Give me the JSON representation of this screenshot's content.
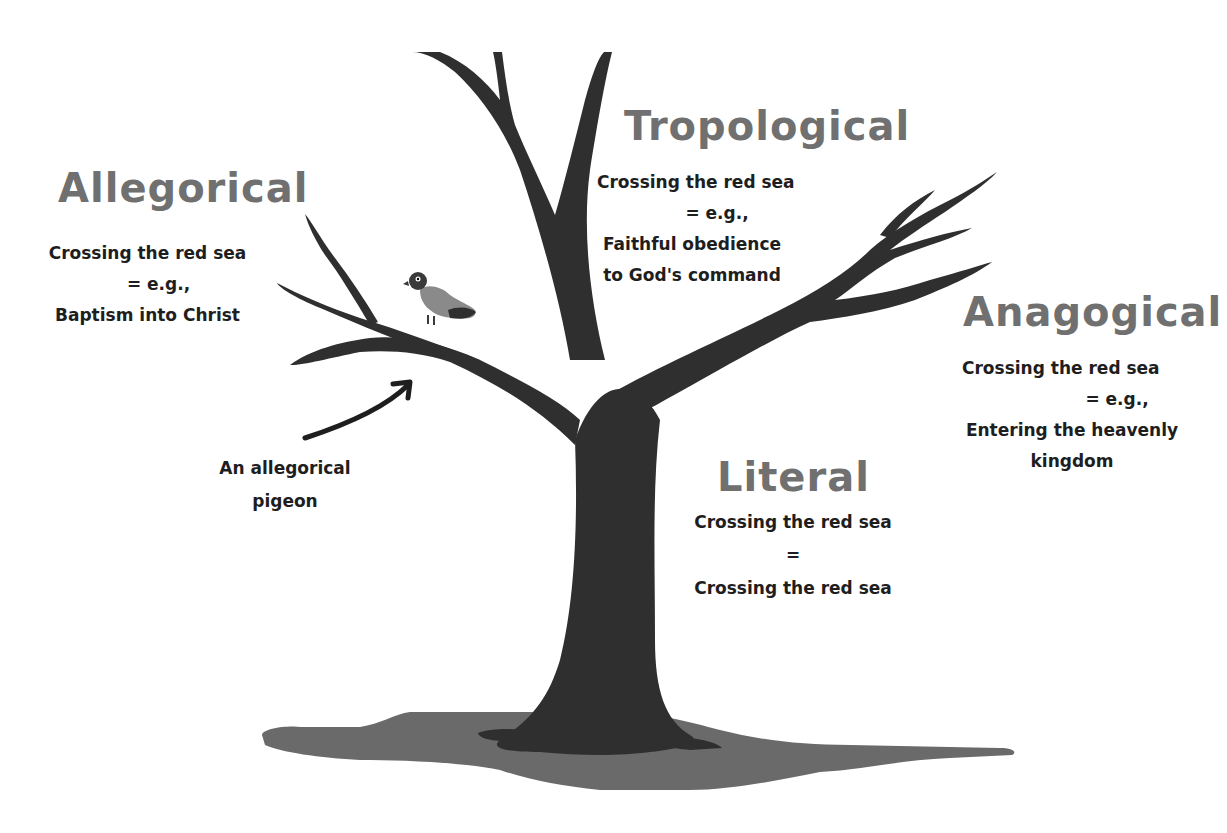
{
  "colors": {
    "tree": "#2f2f2f",
    "shadow": "#6a6a6a",
    "title": "#707070",
    "text": "#1e1e1e",
    "pigeon_body": "#8a8a8a",
    "background": "#ffffff"
  },
  "senses": {
    "allegorical": {
      "title": "Allegorical",
      "line1": "Crossing the red sea",
      "line2": "=  e.g.,",
      "line3": "Baptism into Christ"
    },
    "tropological": {
      "title": "Tropological",
      "line1": "Crossing the red sea",
      "line2": "=  e.g.,",
      "line3": "Faithful obedience",
      "line4": "to God's command"
    },
    "anagogical": {
      "title": "Anagogical",
      "line1": "Crossing the red sea",
      "line2": "=  e.g.,",
      "line3": "Entering the heavenly",
      "line4": "kingdom"
    },
    "literal": {
      "title": "Literal",
      "line1": "Crossing the red sea",
      "line2": "=",
      "line3": "Crossing the red sea"
    }
  },
  "annotation": {
    "line1": "An allegorical",
    "line2": "pigeon",
    "icon": "curved-arrow-icon"
  }
}
